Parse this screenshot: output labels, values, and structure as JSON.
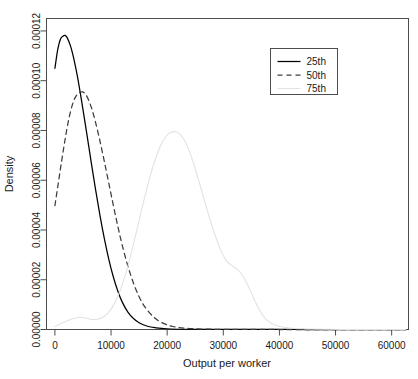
{
  "chart_data": {
    "type": "line",
    "title": "",
    "xlabel": "Output per worker",
    "ylabel": "Density",
    "xlim": [
      -1500,
      63000
    ],
    "ylim": [
      0,
      0.000125
    ],
    "xticks": [
      0,
      10000,
      20000,
      30000,
      40000,
      50000,
      60000
    ],
    "xticklabels": [
      "0",
      "10000",
      "20000",
      "30000",
      "40000",
      "50000",
      "60000"
    ],
    "yticks": [
      0.0,
      2e-05,
      4e-05,
      6e-05,
      8e-05,
      0.0001,
      0.00012
    ],
    "yticklabels": [
      "0.00000",
      "0.00002",
      "0.00004",
      "0.00006",
      "0.00008",
      "0.00010",
      "0.00012"
    ],
    "grid": false,
    "frame": true,
    "legend": {
      "position": "upper-right",
      "entries": [
        {
          "label": "25th",
          "style": "solid",
          "color": "#000000"
        },
        {
          "label": "50th",
          "style": "dashed",
          "color": "#3d3d3d"
        },
        {
          "label": "75th",
          "style": "dotted",
          "color": "#e2e2e2"
        }
      ]
    },
    "series": [
      {
        "name": "25th",
        "style": "solid",
        "color": "#000000",
        "x": [
          0,
          500,
          1000,
          1500,
          1800,
          2200,
          2800,
          3400,
          4000,
          4800,
          5600,
          6400,
          7200,
          8000,
          8800,
          9600,
          10400,
          11200,
          12000,
          13000,
          14000,
          15000,
          16500,
          18000,
          20000,
          23000,
          27000,
          32000,
          38000,
          45000,
          52000,
          60000,
          62500
        ],
        "y": [
          0.000105,
          0.0001125,
          0.0001168,
          0.000118,
          0.0001182,
          0.0001172,
          0.0001138,
          0.0001085,
          0.0001018,
          9.12e-05,
          7.98e-05,
          6.82e-05,
          5.68e-05,
          4.62e-05,
          3.66e-05,
          2.82e-05,
          2.12e-05,
          1.55e-05,
          1.1e-05,
          7e-06,
          4.4e-06,
          2.7e-06,
          1.3e-06,
          7e-07,
          3e-07,
          1e-07,
          5e-08,
          2e-08,
          1e-08,
          0.0,
          0.0,
          0.0,
          0.0
        ]
      },
      {
        "name": "50th",
        "style": "dashed",
        "color": "#3d3d3d",
        "x": [
          0,
          600,
          1200,
          1800,
          2400,
          3000,
          3600,
          4200,
          4800,
          5200,
          5800,
          6500,
          7200,
          8000,
          8800,
          9600,
          10400,
          11200,
          12000,
          13000,
          14000,
          15000,
          16000,
          17500,
          19000,
          21000,
          24000,
          28000,
          33000,
          40000,
          48000,
          56000,
          62500
        ],
        "y": [
          4.98e-05,
          5.88e-05,
          6.78e-05,
          7.62e-05,
          8.38e-05,
          8.95e-05,
          9.32e-05,
          9.5e-05,
          9.55e-05,
          9.52e-05,
          9.32e-05,
          8.92e-05,
          8.36e-05,
          7.6e-05,
          6.76e-05,
          5.88e-05,
          5e-05,
          4.16e-05,
          3.38e-05,
          2.55e-05,
          1.86e-05,
          1.32e-05,
          9.2e-06,
          5.2e-06,
          2.8e-06,
          1.2e-06,
          4e-07,
          1e-07,
          4e-08,
          0.0,
          0.0,
          0.0,
          0.0
        ]
      },
      {
        "name": "75th",
        "style": "dotted",
        "color": "#e2e2e2",
        "x": [
          0,
          1500,
          3000,
          4500,
          5500,
          7000,
          8500,
          10000,
          11500,
          13000,
          14500,
          16000,
          17500,
          19000,
          20200,
          21500,
          22500,
          23500,
          24500,
          25500,
          26500,
          27500,
          28500,
          29500,
          30500,
          31500,
          32500,
          33500,
          34500,
          35500,
          36500,
          37500,
          39000,
          41000,
          44000,
          48000,
          53000,
          58000,
          62500
        ],
        "y": [
          1.2e-06,
          2.8e-06,
          4.2e-06,
          4.8e-06,
          4.6e-06,
          4e-06,
          4.8e-06,
          8.2e-06,
          1.5e-05,
          2.55e-05,
          3.9e-05,
          5.32e-05,
          6.58e-05,
          7.48e-05,
          7.86e-05,
          7.95e-05,
          7.8e-05,
          7.42e-05,
          6.82e-05,
          6.08e-05,
          5.3e-05,
          4.52e-05,
          3.82e-05,
          3.22e-05,
          2.78e-05,
          2.58e-05,
          2.42e-05,
          2.15e-05,
          1.72e-05,
          1.22e-05,
          7.6e-06,
          4.4e-06,
          2e-06,
          8e-07,
          3e-07,
          1e-07,
          0.0,
          0.0,
          0.0
        ]
      }
    ]
  }
}
